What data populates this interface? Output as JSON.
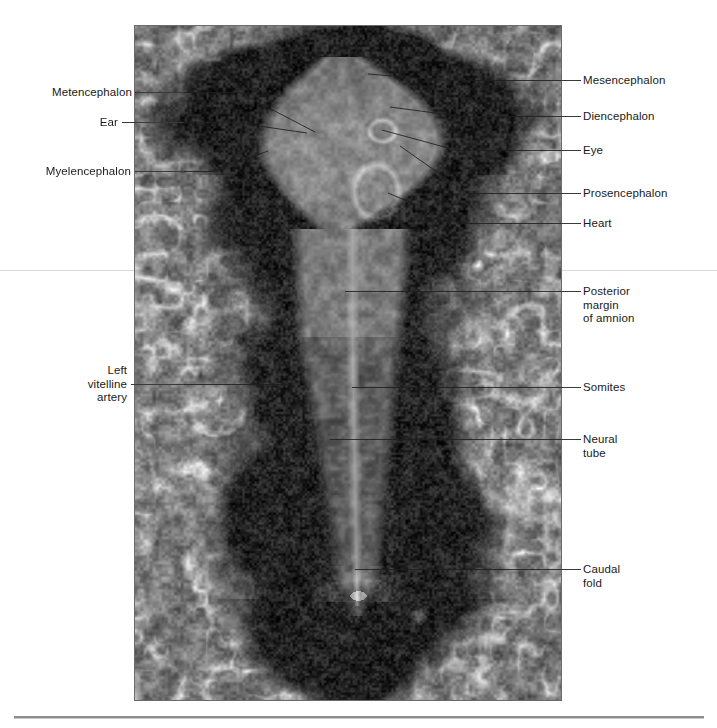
{
  "figure": {
    "kind": "photomicrograph",
    "photo": {
      "name": "embryo-photograph",
      "x": 135,
      "y": 26,
      "width": 426,
      "height": 674,
      "border_color": "#6b6b6b",
      "tone_light": "#d6d6d6",
      "tone_mid": "#8e8e8e",
      "tone_dark": "#101010"
    },
    "rules": [
      {
        "name": "upper-page-rule",
        "x": 0,
        "y": 270,
        "width": 717,
        "color": "#d8d8d8"
      },
      {
        "name": "lower-page-rule",
        "x": 14,
        "y": 716,
        "width": 690,
        "color": "#8d8d8d"
      }
    ]
  },
  "labels_left": [
    {
      "id": "metencephalon",
      "text": "Metencephalon",
      "text_x": 34,
      "text_y": 86,
      "line_x": 136,
      "line_w": 48,
      "line_y": 92,
      "tip_x": 315,
      "tip_y": 132
    },
    {
      "id": "ear",
      "text": "Ear",
      "text_x": 90,
      "text_y": 116,
      "line_x": 122,
      "line_w": 62,
      "line_y": 122,
      "tip_x": 307,
      "tip_y": 133
    },
    {
      "id": "myelencephalon",
      "text": "Myelencephalon",
      "text_x": 33,
      "text_y": 165,
      "line_x": 135,
      "line_w": 49,
      "line_y": 171,
      "tip_x": 268,
      "tip_y": 151
    },
    {
      "id": "left-vitelline-artery",
      "text": "Left\nvitelline\nartery",
      "text_x": 74,
      "text_y": 364,
      "line_x": 131,
      "line_w": 53,
      "line_y": 384,
      "tip_x": 290,
      "tip_y": 384
    }
  ],
  "labels_right": [
    {
      "id": "mesencephalon",
      "text": "Mesencephalon",
      "text_x": 583,
      "text_y": 74,
      "line_x": 561,
      "line_w": 20,
      "line_y": 80,
      "tip_x": 368,
      "tip_y": 74
    },
    {
      "id": "diencephalon",
      "text": "Diencephalon",
      "text_x": 583,
      "text_y": 110,
      "line_x": 561,
      "line_w": 20,
      "line_y": 116,
      "tip_x": 390,
      "tip_y": 107
    },
    {
      "id": "eye",
      "text": "Eye",
      "text_x": 583,
      "text_y": 144,
      "line_x": 561,
      "line_w": 20,
      "line_y": 150,
      "tip_x": 382,
      "tip_y": 130
    },
    {
      "id": "prosencephalon",
      "text": "Prosencephalon",
      "text_x": 583,
      "text_y": 187,
      "line_x": 561,
      "line_w": 20,
      "line_y": 193,
      "tip_x": 400,
      "tip_y": 146
    },
    {
      "id": "heart",
      "text": "Heart",
      "text_x": 583,
      "text_y": 217,
      "line_x": 561,
      "line_w": 20,
      "line_y": 223,
      "tip_x": 388,
      "tip_y": 193
    },
    {
      "id": "posterior-margin-of-amnion",
      "text": "Posterior\nmargin\nof amnion",
      "text_x": 583,
      "text_y": 285,
      "line_x": 561,
      "line_w": 20,
      "line_y": 291,
      "tip_x": 345,
      "tip_y": 291
    },
    {
      "id": "somites",
      "text": "Somites",
      "text_x": 583,
      "text_y": 381,
      "line_x": 561,
      "line_w": 20,
      "line_y": 387,
      "tip_x": 352,
      "tip_y": 387
    },
    {
      "id": "neural-tube",
      "text": "Neural\ntube",
      "text_x": 583,
      "text_y": 433,
      "line_x": 561,
      "line_w": 20,
      "line_y": 439,
      "tip_x": 330,
      "tip_y": 439
    },
    {
      "id": "caudal-fold",
      "text": "Caudal\nfold",
      "text_x": 583,
      "text_y": 563,
      "line_x": 561,
      "line_w": 20,
      "line_y": 569,
      "tip_x": 355,
      "tip_y": 569
    }
  ],
  "annotations_all": [
    "Metencephalon",
    "Ear",
    "Myelencephalon",
    "Left vitelline artery",
    "Mesencephalon",
    "Diencephalon",
    "Eye",
    "Prosencephalon",
    "Heart",
    "Posterior margin of amnion",
    "Somites",
    "Neural tube",
    "Caudal fold"
  ]
}
